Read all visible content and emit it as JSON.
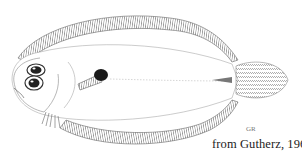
{
  "illustration": {
    "subject": "flatfish line drawing (lateral view, eyes on left side)",
    "caption": "from Gutherz, 1967",
    "signature": "GR",
    "colors": {
      "background": "#ffffff",
      "ink": "#333333",
      "fin_hatching": "#555555",
      "pectoral_blotch": "#1a1a1a"
    }
  }
}
